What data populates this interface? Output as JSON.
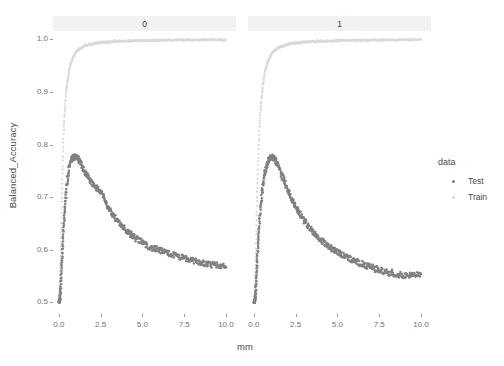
{
  "chart_data": {
    "type": "scatter",
    "title": "",
    "xlabel": "mm",
    "ylabel": "Balanced_Accuracy",
    "xlim": [
      -0.35,
      10.6
    ],
    "ylim": [
      0.478,
      1.012
    ],
    "grid": false,
    "legend": {
      "position": "right",
      "title": "data",
      "entries": [
        {
          "name": "Test",
          "color": "#808080",
          "marker": "point"
        },
        {
          "name": "Train",
          "color": "#d9d9d9",
          "marker": "point"
        }
      ]
    },
    "facets": {
      "variable": "",
      "levels": [
        "0",
        "1"
      ],
      "strip_background": "#f2f2f2"
    },
    "x_ticks": [
      "0.0",
      "2.5",
      "5.0",
      "7.5",
      "10.0"
    ],
    "x_tick_values": [
      0.0,
      2.5,
      5.0,
      7.5,
      10.0
    ],
    "y_ticks": [
      "0.5",
      "0.6",
      "0.7",
      "0.8",
      "0.9",
      "1.0"
    ],
    "y_tick_values": [
      0.5,
      0.6,
      0.7,
      0.8,
      0.9,
      1.0
    ],
    "panels": [
      {
        "facet": "0",
        "series": [
          {
            "name": "Train",
            "color": "#d9d9d9",
            "x": [
              0.02,
              0.05,
              0.08,
              0.12,
              0.16,
              0.2,
              0.25,
              0.3,
              0.35,
              0.4,
              0.45,
              0.5,
              0.6,
              0.7,
              0.8,
              0.9,
              1.0,
              1.1,
              1.2,
              1.4,
              1.6,
              1.8,
              2.0,
              2.3,
              2.6,
              3.0,
              3.4,
              3.8,
              4.3,
              4.8,
              5.4,
              6.0,
              6.7,
              7.4,
              8.1,
              8.8,
              9.4,
              10.0
            ],
            "y": [
              0.5,
              0.52,
              0.56,
              0.62,
              0.68,
              0.73,
              0.785,
              0.83,
              0.862,
              0.885,
              0.903,
              0.917,
              0.938,
              0.952,
              0.962,
              0.969,
              0.974,
              0.978,
              0.981,
              0.985,
              0.988,
              0.99,
              0.991,
              0.993,
              0.994,
              0.995,
              0.996,
              0.9965,
              0.997,
              0.9975,
              0.998,
              0.998,
              0.9985,
              0.9985,
              0.999,
              0.999,
              0.999,
              0.999
            ]
          },
          {
            "name": "Test",
            "color": "#808080",
            "x": [
              0.02,
              0.05,
              0.08,
              0.11,
              0.14,
              0.17,
              0.2,
              0.23,
              0.26,
              0.3,
              0.34,
              0.38,
              0.42,
              0.46,
              0.5,
              0.55,
              0.6,
              0.65,
              0.7,
              0.75,
              0.8,
              0.85,
              0.9,
              0.95,
              1.0,
              1.05,
              1.1,
              1.2,
              1.3,
              1.4,
              1.5,
              1.6,
              1.7,
              1.8,
              1.9,
              2.0,
              2.1,
              2.2,
              2.3,
              2.4,
              2.5,
              2.6,
              2.7,
              2.8,
              2.9,
              3.0,
              3.2,
              3.4,
              3.6,
              3.8,
              4.0,
              4.2,
              4.4,
              4.6,
              4.8,
              5.0,
              5.3,
              5.6,
              5.9,
              6.2,
              6.5,
              6.8,
              7.1,
              7.4,
              7.7,
              8.0,
              8.3,
              8.6,
              8.9,
              9.2,
              9.5,
              9.8,
              10.0
            ],
            "y": [
              0.5,
              0.505,
              0.515,
              0.53,
              0.55,
              0.572,
              0.592,
              0.61,
              0.63,
              0.652,
              0.672,
              0.69,
              0.705,
              0.718,
              0.73,
              0.742,
              0.752,
              0.76,
              0.766,
              0.77,
              0.773,
              0.775,
              0.776,
              0.777,
              0.777,
              0.776,
              0.774,
              0.77,
              0.765,
              0.758,
              0.752,
              0.746,
              0.74,
              0.735,
              0.73,
              0.726,
              0.722,
              0.718,
              0.716,
              0.714,
              0.712,
              0.706,
              0.698,
              0.69,
              0.684,
              0.678,
              0.668,
              0.66,
              0.652,
              0.645,
              0.638,
              0.632,
              0.627,
              0.622,
              0.618,
              0.614,
              0.608,
              0.603,
              0.6,
              0.597,
              0.594,
              0.591,
              0.588,
              0.585,
              0.582,
              0.58,
              0.577,
              0.575,
              0.573,
              0.571,
              0.57,
              0.569,
              0.568
            ]
          }
        ]
      },
      {
        "facet": "1",
        "series": [
          {
            "name": "Train",
            "color": "#d9d9d9",
            "x": [
              0.02,
              0.05,
              0.08,
              0.12,
              0.16,
              0.2,
              0.25,
              0.3,
              0.35,
              0.4,
              0.45,
              0.5,
              0.6,
              0.7,
              0.8,
              0.9,
              1.0,
              1.1,
              1.2,
              1.4,
              1.6,
              1.8,
              2.0,
              2.3,
              2.6,
              3.0,
              3.4,
              3.8,
              4.3,
              4.8,
              5.4,
              6.0,
              6.7,
              7.4,
              8.1,
              8.8,
              9.4,
              10.0
            ],
            "y": [
              0.5,
              0.515,
              0.545,
              0.6,
              0.655,
              0.705,
              0.758,
              0.802,
              0.838,
              0.864,
              0.885,
              0.901,
              0.925,
              0.942,
              0.954,
              0.963,
              0.969,
              0.974,
              0.978,
              0.983,
              0.986,
              0.988,
              0.99,
              0.992,
              0.993,
              0.9945,
              0.9955,
              0.996,
              0.9965,
              0.997,
              0.9975,
              0.998,
              0.998,
              0.9985,
              0.9985,
              0.999,
              0.999,
              0.999
            ]
          },
          {
            "name": "Test",
            "color": "#808080",
            "x": [
              0.02,
              0.05,
              0.08,
              0.11,
              0.14,
              0.17,
              0.2,
              0.23,
              0.26,
              0.3,
              0.34,
              0.38,
              0.42,
              0.46,
              0.5,
              0.55,
              0.6,
              0.65,
              0.7,
              0.75,
              0.8,
              0.85,
              0.9,
              0.95,
              1.0,
              1.05,
              1.1,
              1.15,
              1.2,
              1.3,
              1.4,
              1.5,
              1.6,
              1.7,
              1.8,
              1.9,
              2.0,
              2.1,
              2.2,
              2.3,
              2.4,
              2.5,
              2.6,
              2.8,
              3.0,
              3.2,
              3.4,
              3.6,
              3.8,
              4.0,
              4.3,
              4.6,
              4.9,
              5.2,
              5.5,
              5.8,
              6.1,
              6.4,
              6.7,
              7.0,
              7.3,
              7.6,
              7.9,
              8.2,
              8.5,
              8.8,
              9.1,
              9.4,
              9.7,
              10.0
            ],
            "y": [
              0.5,
              0.503,
              0.51,
              0.522,
              0.538,
              0.556,
              0.575,
              0.594,
              0.612,
              0.632,
              0.652,
              0.67,
              0.686,
              0.7,
              0.712,
              0.724,
              0.735,
              0.744,
              0.752,
              0.758,
              0.764,
              0.768,
              0.771,
              0.773,
              0.775,
              0.776,
              0.776,
              0.775,
              0.773,
              0.768,
              0.762,
              0.755,
              0.748,
              0.74,
              0.732,
              0.724,
              0.716,
              0.708,
              0.701,
              0.695,
              0.689,
              0.683,
              0.677,
              0.666,
              0.656,
              0.647,
              0.639,
              0.632,
              0.625,
              0.619,
              0.611,
              0.604,
              0.598,
              0.592,
              0.587,
              0.582,
              0.578,
              0.574,
              0.57,
              0.567,
              0.564,
              0.561,
              0.558,
              0.556,
              0.554,
              0.553,
              0.552,
              0.551,
              0.551,
              0.551
            ]
          }
        ]
      }
    ]
  },
  "axes": {
    "y_title": "Balanced_Accuracy",
    "x_title": "mm"
  },
  "legend": {
    "title": "data",
    "test_label": "Test",
    "train_label": "Train"
  },
  "strips": {
    "left": "0",
    "right": "1"
  },
  "ticks": {
    "y": [
      "1.0",
      "0.9",
      "0.8",
      "0.7",
      "0.6",
      "0.5"
    ],
    "x": [
      "0.0",
      "2.5",
      "5.0",
      "7.5",
      "10.0"
    ]
  },
  "colors": {
    "test": "#808080",
    "train": "#d9d9d9",
    "strip_bg": "#f2f2f2",
    "text": "#4a4a4a",
    "tick_text": "#707070"
  }
}
